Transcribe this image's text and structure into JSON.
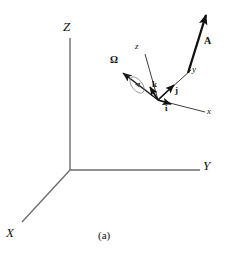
{
  "figure": {
    "caption": "(a)",
    "background_color": "#ffffff",
    "line_color": "#6b6b6b",
    "vector_color": "#111111",
    "text_color": "#111111",
    "width": 228,
    "height": 254
  },
  "global_frame": {
    "name": "inertial-frame",
    "origin": {
      "x": 70,
      "y": 170
    },
    "axes": [
      {
        "label": "Z",
        "id": "axis-z-global",
        "tip": {
          "x": 70,
          "y": 38
        },
        "label_pos": {
          "x": 64,
          "y": 21
        }
      },
      {
        "label": "Y",
        "id": "axis-y-global",
        "tip": {
          "x": 200,
          "y": 170
        },
        "label_pos": {
          "x": 203,
          "y": 160
        }
      },
      {
        "label": "X",
        "id": "axis-x-global",
        "tip": {
          "x": 22,
          "y": 222
        },
        "label_pos": {
          "x": 7,
          "y": 227
        }
      }
    ]
  },
  "local_frame": {
    "name": "rotating-body-frame",
    "origin": {
      "x": 158,
      "y": 100
    },
    "axes": [
      {
        "label": "z",
        "id": "axis-z-local",
        "tip": {
          "x": 144,
          "y": 52
        },
        "label_pos": {
          "x": 136,
          "y": 43
        }
      },
      {
        "label": "y",
        "id": "axis-y-local",
        "tip": {
          "x": 192,
          "y": 68
        },
        "label_pos": {
          "x": 193,
          "y": 69
        }
      },
      {
        "label": "x",
        "id": "axis-x-local",
        "tip": {
          "x": 206,
          "y": 113
        },
        "label_pos": {
          "x": 208,
          "y": 108
        }
      }
    ],
    "unit_vectors": [
      {
        "label": "i",
        "id": "unit-vector-i",
        "tip": {
          "x": 172,
          "y": 106
        },
        "label_pos": {
          "x": 166,
          "y": 108
        }
      },
      {
        "label": "j",
        "id": "unit-vector-j",
        "tip": {
          "x": 176,
          "y": 86
        },
        "label_pos": {
          "x": 176,
          "y": 90
        }
      },
      {
        "label": "k",
        "id": "unit-vector-k",
        "tip": {
          "x": 149,
          "y": 88
        },
        "label_pos": {
          "x": 154,
          "y": 84
        }
      }
    ]
  },
  "angular_velocity": {
    "label": "Ω",
    "id": "angular-velocity-vector",
    "tail": {
      "x": 158,
      "y": 100
    },
    "tip": {
      "x": 121,
      "y": 71
    },
    "label_pos": {
      "x": 111,
      "y": 57
    },
    "spin_ellipse": {
      "cx": 137,
      "cy": 85,
      "rx": 5,
      "ry": 9,
      "rotation_deg": -38
    }
  },
  "vector_A": {
    "label": "A",
    "id": "vector-a",
    "tail": {
      "x": 188,
      "y": 73
    },
    "tip": {
      "x": 207,
      "y": 11
    },
    "label_pos": {
      "x": 205,
      "y": 38
    }
  }
}
